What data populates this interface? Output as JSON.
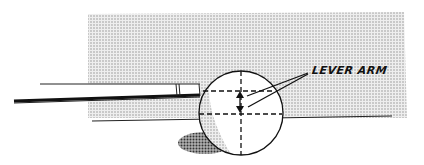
{
  "diagram": {
    "annotation": {
      "text": "LEVER ARM",
      "arrows": 2
    },
    "elements": [
      "shaded table surface",
      "cue stick",
      "cue ball",
      "horizontal center line",
      "horizontal contact line",
      "vertical center line",
      "lever arm double arrow",
      "ball shadow"
    ],
    "colors": {
      "ink": "#111111",
      "shade": "#d6d6d6",
      "shadow": "#8a8a8a",
      "background": "#ffffff"
    }
  }
}
